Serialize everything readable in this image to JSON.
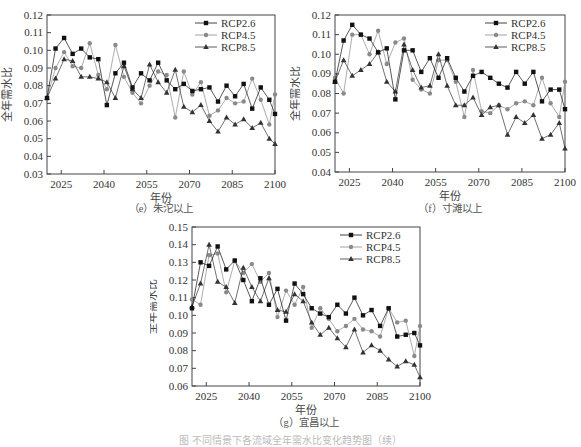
{
  "figure_caption": "图 不同情景下各流域全年需水比变化趋势图（续）",
  "legend": [
    {
      "name": "RCP2.6",
      "marker": "square",
      "color": "#111111"
    },
    {
      "name": "RCP4.5",
      "marker": "circle",
      "color": "#8a8a8a"
    },
    {
      "name": "RCP8.5",
      "marker": "triangle",
      "color": "#333333"
    }
  ],
  "chart_data": [
    {
      "type": "line",
      "id": "e",
      "title": "（e）朱沱以上",
      "xlabel": "年份",
      "ylabel": "全年需水比",
      "xlim": [
        2020,
        2100
      ],
      "xticks": [
        2025,
        2040,
        2055,
        2070,
        2085,
        2100
      ],
      "ylim": [
        0.03,
        0.12
      ],
      "yticks": [
        0.03,
        0.04,
        0.05,
        0.06,
        0.07,
        0.08,
        0.09,
        0.1,
        0.11,
        0.12
      ],
      "legend_position": "upper right",
      "x": [
        2020,
        2023,
        2026,
        2029,
        2032,
        2035,
        2038,
        2041,
        2044,
        2047,
        2050,
        2053,
        2056,
        2059,
        2062,
        2065,
        2068,
        2071,
        2074,
        2077,
        2080,
        2083,
        2086,
        2089,
        2092,
        2095,
        2098,
        2100
      ],
      "series": [
        {
          "name": "RCP2.6",
          "values": [
            0.073,
            0.101,
            0.107,
            0.098,
            0.101,
            0.096,
            0.095,
            0.069,
            0.087,
            0.093,
            0.079,
            0.087,
            0.083,
            0.093,
            0.083,
            0.078,
            0.081,
            0.077,
            0.078,
            0.079,
            0.071,
            0.08,
            0.074,
            0.081,
            0.067,
            0.079,
            0.072,
            0.064
          ]
        },
        {
          "name": "RCP4.5",
          "values": [
            0.073,
            0.09,
            0.099,
            0.091,
            0.09,
            0.104,
            0.086,
            0.078,
            0.103,
            0.085,
            0.076,
            0.07,
            0.08,
            0.088,
            0.086,
            0.062,
            0.088,
            0.075,
            0.082,
            0.063,
            0.066,
            0.073,
            0.07,
            0.071,
            0.084,
            0.072,
            0.058,
            0.075
          ]
        },
        {
          "name": "RCP8.5",
          "values": [
            0.073,
            0.084,
            0.095,
            0.094,
            0.085,
            0.085,
            0.084,
            0.082,
            0.073,
            0.091,
            0.078,
            0.073,
            0.092,
            0.082,
            0.076,
            0.089,
            0.068,
            0.065,
            0.069,
            0.06,
            0.054,
            0.062,
            0.058,
            0.061,
            0.056,
            0.059,
            0.05,
            0.047
          ]
        }
      ]
    },
    {
      "type": "line",
      "id": "f",
      "title": "（f）寸滩以上",
      "xlabel": "年份",
      "ylabel": "全年需水比",
      "xlim": [
        2020,
        2100
      ],
      "xticks": [
        2025,
        2040,
        2055,
        2070,
        2085,
        2100
      ],
      "ylim": [
        0.04,
        0.12
      ],
      "yticks": [
        0.04,
        0.05,
        0.06,
        0.07,
        0.08,
        0.09,
        0.1,
        0.11,
        0.12
      ],
      "legend_position": "upper right",
      "x": [
        2020,
        2023,
        2026,
        2029,
        2032,
        2035,
        2038,
        2041,
        2044,
        2047,
        2050,
        2053,
        2056,
        2059,
        2062,
        2065,
        2068,
        2071,
        2074,
        2077,
        2080,
        2083,
        2086,
        2089,
        2092,
        2095,
        2098,
        2100
      ],
      "series": [
        {
          "name": "RCP2.6",
          "values": [
            0.086,
            0.107,
            0.115,
            0.11,
            0.108,
            0.101,
            0.103,
            0.077,
            0.102,
            0.102,
            0.091,
            0.098,
            0.088,
            0.098,
            0.088,
            0.081,
            0.089,
            0.091,
            0.088,
            0.085,
            0.083,
            0.091,
            0.085,
            0.091,
            0.076,
            0.082,
            0.082,
            0.072
          ]
        },
        {
          "name": "RCP4.5",
          "values": [
            0.088,
            0.08,
            0.11,
            0.11,
            0.1,
            0.112,
            0.095,
            0.106,
            0.108,
            0.087,
            0.082,
            0.08,
            0.097,
            0.097,
            0.086,
            0.068,
            0.092,
            0.071,
            0.07,
            0.074,
            0.072,
            0.075,
            0.076,
            0.074,
            0.088,
            0.075,
            0.068,
            0.086
          ]
        },
        {
          "name": "RCP8.5",
          "values": [
            0.086,
            0.097,
            0.089,
            0.092,
            0.095,
            0.101,
            0.086,
            0.081,
            0.105,
            0.092,
            0.083,
            0.084,
            0.1,
            0.084,
            0.074,
            0.074,
            0.078,
            0.069,
            0.073,
            0.074,
            0.059,
            0.068,
            0.065,
            0.069,
            0.057,
            0.059,
            0.065,
            0.052
          ]
        }
      ]
    },
    {
      "type": "line",
      "id": "g",
      "title": "（g）宜昌以上",
      "xlabel": "年份",
      "ylabel": "全年需水比",
      "xlim": [
        2020,
        2100
      ],
      "xticks": [
        2025,
        2040,
        2055,
        2070,
        2085,
        2100
      ],
      "ylim": [
        0.06,
        0.15
      ],
      "yticks": [
        0.06,
        0.07,
        0.08,
        0.09,
        0.1,
        0.11,
        0.12,
        0.13,
        0.14,
        0.15
      ],
      "legend_position": "upper right",
      "x": [
        2020,
        2023,
        2026,
        2029,
        2032,
        2035,
        2038,
        2041,
        2044,
        2047,
        2050,
        2053,
        2056,
        2059,
        2062,
        2065,
        2068,
        2071,
        2074,
        2077,
        2080,
        2083,
        2086,
        2089,
        2092,
        2095,
        2098,
        2100
      ],
      "series": [
        {
          "name": "RCP2.6",
          "values": [
            0.104,
            0.13,
            0.128,
            0.139,
            0.126,
            0.131,
            0.12,
            0.108,
            0.121,
            0.106,
            0.115,
            0.097,
            0.118,
            0.112,
            0.104,
            0.101,
            0.099,
            0.106,
            0.101,
            0.11,
            0.1,
            0.103,
            0.094,
            0.104,
            0.088,
            0.089,
            0.09,
            0.083
          ]
        },
        {
          "name": "RCP4.5",
          "values": [
            0.109,
            0.106,
            0.134,
            0.135,
            0.113,
            0.131,
            0.124,
            0.129,
            0.119,
            0.124,
            0.099,
            0.114,
            0.106,
            0.116,
            0.093,
            0.104,
            0.098,
            0.091,
            0.094,
            0.098,
            0.092,
            0.091,
            0.088,
            0.104,
            0.096,
            0.097,
            0.077,
            0.094
          ]
        },
        {
          "name": "RCP8.5",
          "values": [
            0.105,
            0.118,
            0.14,
            0.119,
            0.116,
            0.107,
            0.127,
            0.116,
            0.108,
            0.121,
            0.103,
            0.102,
            0.112,
            0.108,
            0.096,
            0.089,
            0.093,
            0.087,
            0.082,
            0.092,
            0.079,
            0.083,
            0.08,
            0.075,
            0.071,
            0.074,
            0.072,
            0.065
          ]
        }
      ]
    }
  ]
}
